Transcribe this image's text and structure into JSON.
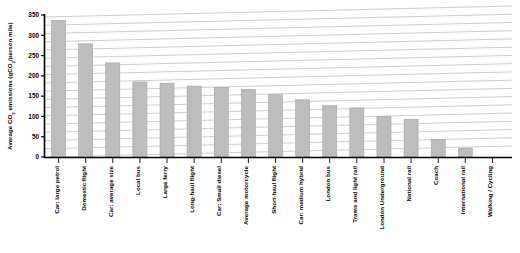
{
  "chart_data": {
    "type": "bar",
    "title": "",
    "xlabel": "",
    "ylabel": "Average CO2 emissions (gCO2/person mile)",
    "ylabel_parts": {
      "prefix": "Average CO",
      "sub1": "2",
      "middle": " emissions (gCO",
      "sub2": "2",
      "suffix": "/person mile)"
    },
    "ylim": [
      0,
      350
    ],
    "ytick_values": [
      0,
      50,
      100,
      150,
      200,
      250,
      300,
      350
    ],
    "ytick_labels": [
      "0",
      "50",
      "100",
      "150",
      "200",
      "250",
      "300",
      "350"
    ],
    "grid": true,
    "grid_orientation": "horizontal-slanted",
    "legend": "none",
    "bar_color": "#bdbdbd",
    "bar_edge_color": "#9a9a9a",
    "axis_color": "#000000",
    "grid_color": "#b8b8b8",
    "background_color": "#ffffff",
    "categories": [
      "Car: large petrol",
      "Domestic flight",
      "Car: average size",
      "Local bus",
      "Large ferry",
      "Long-haul flight",
      "Car: Small diesel",
      "Average motorcycle",
      "Short-haul flight",
      "Car: medium hybrid",
      "London bus",
      "Trams and light rail",
      "London Underground",
      "National rail",
      "Coach",
      "International rail",
      "Walking / Cycling"
    ],
    "values": [
      337,
      279,
      232,
      185,
      182,
      175,
      172,
      167,
      154,
      141,
      127,
      121,
      100,
      93,
      43,
      22,
      0
    ]
  }
}
